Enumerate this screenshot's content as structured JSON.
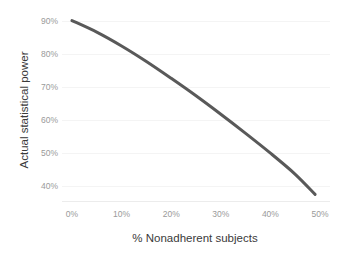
{
  "chart_data": {
    "type": "line",
    "title": "",
    "subtitle": "",
    "xlabel": "% Nonadherent subjects",
    "ylabel": "Actual statistical power",
    "xlim": [
      -2,
      52
    ],
    "ylim": [
      35,
      92
    ],
    "grid": true,
    "legend": "none",
    "line_color": "#595959",
    "line_width": 3,
    "x_tick_labels": [
      "0%",
      "10%",
      "20%",
      "30%",
      "40%",
      "50%"
    ],
    "x_tick_values": [
      0,
      10,
      20,
      30,
      40,
      50
    ],
    "y_tick_labels": [
      "40%",
      "50%",
      "60%",
      "70%",
      "80%",
      "90%"
    ],
    "y_tick_values": [
      40,
      50,
      60,
      70,
      80,
      90
    ],
    "series": [
      {
        "name": "Actual statistical power",
        "x": [
          0,
          5,
          10,
          15,
          20,
          25,
          30,
          35,
          40,
          45,
          49
        ],
        "values": [
          90.0,
          86.5,
          82.3,
          77.6,
          72.5,
          67.2,
          61.6,
          55.8,
          49.8,
          43.4,
          37.3
        ]
      }
    ]
  },
  "axes": {
    "y_title": "Actual statistical power",
    "x_title": "% Nonadherent subjects"
  }
}
